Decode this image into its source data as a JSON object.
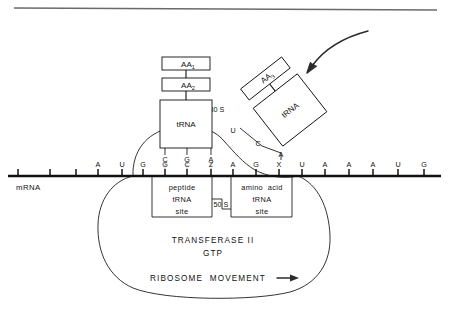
{
  "figure": {
    "top_rule": true
  },
  "mrna": {
    "label": "mRNA",
    "bases": [
      {
        "letter": "",
        "x": 18
      },
      {
        "letter": "",
        "x": 50
      },
      {
        "letter": "",
        "x": 76
      },
      {
        "letter": "A",
        "x": 98
      },
      {
        "letter": "U",
        "x": 122
      },
      {
        "letter": "G",
        "x": 143
      },
      {
        "letter": "G",
        "x": 165
      },
      {
        "letter": "C",
        "x": 187
      },
      {
        "letter": "Z",
        "x": 211
      },
      {
        "letter": "A",
        "x": 233
      },
      {
        "letter": "G",
        "x": 256
      },
      {
        "letter": "X",
        "x": 279
      },
      {
        "letter": "U",
        "x": 302
      },
      {
        "letter": "A",
        "x": 325
      },
      {
        "letter": "A",
        "x": 349
      },
      {
        "letter": "A",
        "x": 373
      },
      {
        "letter": "U",
        "x": 398
      },
      {
        "letter": "G",
        "x": 424
      }
    ]
  },
  "peptidyl_trna": {
    "box_label": "tRNA",
    "anticodon": [
      {
        "letter": "C",
        "x": 165
      },
      {
        "letter": "G",
        "x": 187
      },
      {
        "letter": "A",
        "x": 211
      }
    ],
    "amino_acids": [
      {
        "label": "AA",
        "subscript": "1"
      },
      {
        "label": "AA",
        "subscript": "2"
      }
    ]
  },
  "incoming_trna": {
    "box_label": "tRNA",
    "anticodon": [
      {
        "letter": "U",
        "x": 233,
        "y": 133
      },
      {
        "letter": "C",
        "x": 258,
        "y": 146
      },
      {
        "letter": "A",
        "x": 281,
        "y": 157
      }
    ],
    "amino_acid": {
      "label": "AA",
      "subscript": "3"
    }
  },
  "ribosome": {
    "small_subunit_label": "30 S",
    "large_subunit_label": "50 S",
    "peptide_site": [
      "peptide",
      "tRNA",
      "site"
    ],
    "amino_acid_site": [
      "amino  acid",
      "tRNA",
      "site"
    ],
    "factor_lines": [
      "TRANSFERASE II",
      "GTP"
    ],
    "movement_label": "RIBOSOME  MOVEMENT"
  },
  "annotations": {
    "incoming_arrow": "curved-arrow-pointing-to-incoming-trna",
    "movement_arrow": "right-arrow"
  },
  "colors": {
    "ink": "#111111",
    "rule": "#6a6a6a",
    "pairing": "#555555",
    "arrow": "#2b2b2b",
    "background": "#ffffff"
  }
}
